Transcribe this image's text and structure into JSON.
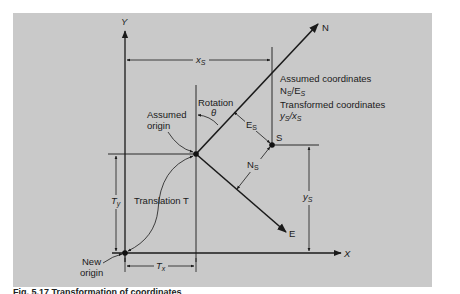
{
  "figure": {
    "axes": {
      "y_label": "Y",
      "x_label": "X",
      "n_label": "N",
      "e_label": "E"
    },
    "points": {
      "s_label": "S",
      "assumed_origin_label_line1": "Assumed",
      "assumed_origin_label_line2": "origin",
      "new_origin_label_line1": "New",
      "new_origin_label_line2": "origin"
    },
    "annotations": {
      "rotation_label": "Rotation",
      "theta_label": "θ",
      "translation_label": "Translation T",
      "assumed_coords_title": "Assumed coordinates",
      "assumed_coords_value": "N",
      "assumed_coords_sub1": "S",
      "assumed_coords_slash": "/E",
      "assumed_coords_sub2": "S",
      "transformed_coords_title": "Transformed coordinates",
      "transformed_coords_y": "y",
      "transformed_coords_sub1": "S",
      "transformed_coords_slash": "/x",
      "transformed_coords_sub2": "S"
    },
    "dimensions": {
      "xs_main": "x",
      "xs_sub": "S",
      "ys_main": "y",
      "ys_sub": "S",
      "es_main": "E",
      "es_sub": "S",
      "ns_main": "N",
      "ns_sub": "S",
      "tx_main": "T",
      "tx_sub": "x",
      "ty_main": "T",
      "ty_sub": "y"
    },
    "caption": "Fig. 5.17 Transformation of coordinates"
  },
  "colors": {
    "panel_bg": "#c9c9c9",
    "ink": "#1a1a1a"
  }
}
